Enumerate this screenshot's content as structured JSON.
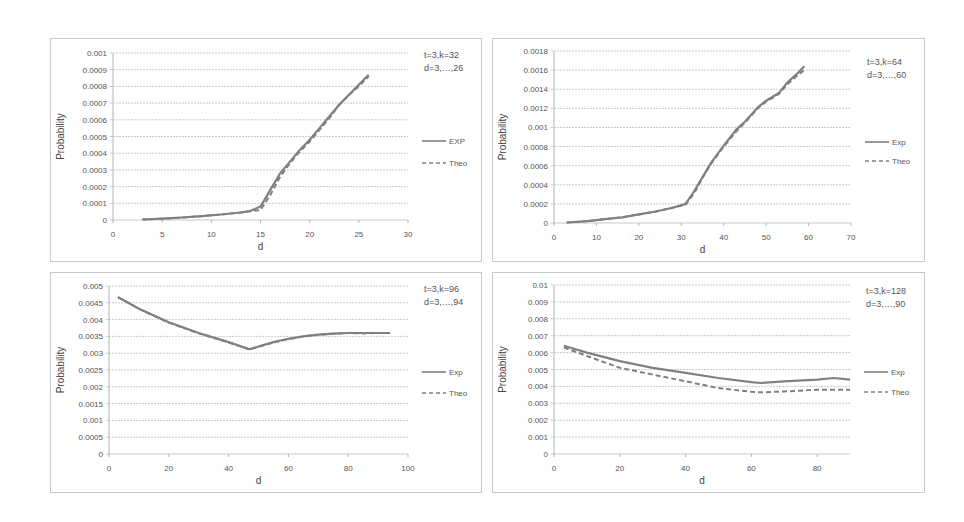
{
  "chart_data": [
    {
      "type": "line",
      "title": "",
      "annotation": [
        "t=3,k=32",
        "d=3,…,26"
      ],
      "xlabel": "d",
      "ylabel": "Probability",
      "xlim": [
        0,
        30
      ],
      "ylim": [
        0,
        0.001
      ],
      "xticks": [
        0,
        5,
        10,
        15,
        20,
        25,
        30
      ],
      "xtick_labels": [
        "0",
        "5",
        "10",
        "15",
        "20",
        "25",
        "30"
      ],
      "yticks": [
        0,
        0.0001,
        0.0002,
        0.0003,
        0.0004,
        0.0005,
        0.0006,
        0.0007,
        0.0008,
        0.0009,
        0.001
      ],
      "ytick_labels": [
        "0",
        "0.0001",
        "0.0002",
        "0.0003",
        "0.0004",
        "0.0005",
        "0.0006",
        "0.0007",
        "0.0008",
        "0.0009",
        "0.001"
      ],
      "grid": true,
      "legend_position": "right",
      "series": [
        {
          "name": "EXP",
          "style": "solid",
          "x": [
            3,
            5,
            7,
            9,
            11,
            13,
            14,
            15,
            16,
            17,
            18,
            19,
            20,
            21,
            22,
            23,
            24,
            25,
            26
          ],
          "y": [
            3e-06,
            8e-06,
            1.5e-05,
            2.3e-05,
            3.3e-05,
            4.5e-05,
            5.5e-05,
            8e-05,
            0.00018,
            0.00028,
            0.00035,
            0.00042,
            0.00048,
            0.00055,
            0.00062,
            0.00069,
            0.00075,
            0.00081,
            0.00087
          ]
        },
        {
          "name": "Theo",
          "style": "dashed",
          "x": [
            3,
            5,
            7,
            9,
            11,
            13,
            14,
            15,
            16,
            17,
            18,
            19,
            20,
            21,
            22,
            23,
            24,
            25,
            26
          ],
          "y": [
            3e-06,
            8e-06,
            1.5e-05,
            2.3e-05,
            3.3e-05,
            4.5e-05,
            5.2e-05,
            6e-05,
            0.00015,
            0.00026,
            0.00034,
            0.00041,
            0.00047,
            0.00054,
            0.00061,
            0.00069,
            0.00075,
            0.0008,
            0.00086
          ]
        }
      ]
    },
    {
      "type": "line",
      "title": "",
      "annotation": [
        "t=3,k=64",
        "d=3,…,60"
      ],
      "xlabel": "d",
      "ylabel": "Probability",
      "xlim": [
        0,
        70
      ],
      "ylim": [
        0,
        0.0018
      ],
      "xticks": [
        0,
        10,
        20,
        30,
        40,
        50,
        60,
        70
      ],
      "xtick_labels": [
        "0",
        "10",
        "20",
        "30",
        "40",
        "50",
        "60",
        "70"
      ],
      "yticks": [
        0,
        0.0002,
        0.0004,
        0.0006,
        0.0008,
        0.001,
        0.0012,
        0.0014,
        0.0016,
        0.0018
      ],
      "ytick_labels": [
        "0",
        "0.0002",
        "0.0004",
        "0.0006",
        "0.0008",
        "0.001",
        "0.0012",
        "0.0014",
        "0.0016",
        "0.0018"
      ],
      "grid": true,
      "legend_position": "right",
      "series": [
        {
          "name": "Exp",
          "style": "solid",
          "x": [
            3,
            8,
            12,
            16,
            20,
            24,
            28,
            31,
            33,
            35,
            37,
            40,
            43,
            45,
            48,
            50,
            53,
            55,
            57,
            59
          ],
          "y": [
            5e-06,
            2e-05,
            4e-05,
            6e-05,
            9e-05,
            0.00012,
            0.00016,
            0.0002,
            0.00033,
            0.00048,
            0.00063,
            0.00081,
            0.00098,
            0.00106,
            0.00121,
            0.00128,
            0.00136,
            0.00147,
            0.00155,
            0.00164
          ]
        },
        {
          "name": "Theo",
          "style": "dashed",
          "x": [
            3,
            8,
            12,
            16,
            20,
            24,
            28,
            31,
            33,
            35,
            37,
            40,
            43,
            45,
            48,
            50,
            53,
            55,
            57,
            59
          ],
          "y": [
            5e-06,
            2e-05,
            4e-05,
            6e-05,
            9e-05,
            0.00012,
            0.00016,
            0.00019,
            0.00031,
            0.00047,
            0.00062,
            0.0008,
            0.00096,
            0.00105,
            0.0012,
            0.00127,
            0.00135,
            0.00145,
            0.00153,
            0.0016
          ]
        }
      ]
    },
    {
      "type": "line",
      "title": "",
      "annotation": [
        "t=3,k=96",
        "d=3,…,94"
      ],
      "xlabel": "d",
      "ylabel": "Probability",
      "xlim": [
        0,
        100
      ],
      "ylim": [
        0,
        0.005
      ],
      "xticks": [
        0,
        20,
        40,
        60,
        80,
        100
      ],
      "xtick_labels": [
        "0",
        "20",
        "40",
        "60",
        "80",
        "100"
      ],
      "yticks": [
        0,
        0.0005,
        0.001,
        0.0015,
        0.002,
        0.0025,
        0.003,
        0.0035,
        0.004,
        0.0045,
        0.005
      ],
      "ytick_labels": [
        "0",
        "0.0005",
        "0.001",
        "0.0015",
        "0.002",
        "0.0025",
        "0.003",
        "0.0035",
        "0.004",
        "0.0045",
        "0.005"
      ],
      "grid": true,
      "legend_position": "right",
      "series": [
        {
          "name": "Exp",
          "style": "solid",
          "x": [
            3,
            10,
            20,
            30,
            40,
            47,
            50,
            55,
            60,
            65,
            70,
            75,
            80,
            85,
            90,
            94
          ],
          "y": [
            0.00467,
            0.00432,
            0.00392,
            0.0036,
            0.00333,
            0.00312,
            0.0032,
            0.00333,
            0.00343,
            0.0035,
            0.00355,
            0.00358,
            0.0036,
            0.0036,
            0.0036,
            0.0036
          ]
        },
        {
          "name": "Theo",
          "style": "dashed",
          "x": [
            3,
            10,
            20,
            30,
            40,
            47,
            50,
            55,
            60,
            65,
            70,
            75,
            80,
            85,
            90,
            94
          ],
          "y": [
            0.00467,
            0.00432,
            0.00391,
            0.00359,
            0.00332,
            0.00311,
            0.00319,
            0.00332,
            0.00342,
            0.0035,
            0.00355,
            0.00358,
            0.0036,
            0.00359,
            0.0036,
            0.0036
          ]
        }
      ]
    },
    {
      "type": "line",
      "title": "",
      "annotation": [
        "t=3,k=128",
        "d=3,…,90"
      ],
      "xlabel": "d",
      "ylabel": "Probability",
      "xlim": [
        0,
        90
      ],
      "ylim": [
        0,
        0.01
      ],
      "xticks": [
        0,
        20,
        40,
        60,
        80
      ],
      "xtick_labels": [
        "0",
        "20",
        "40",
        "60",
        "80"
      ],
      "yticks": [
        0,
        0.001,
        0.002,
        0.003,
        0.004,
        0.005,
        0.006,
        0.007,
        0.008,
        0.009,
        0.01
      ],
      "ytick_labels": [
        "0",
        "0.001",
        "0.002",
        "0.003",
        "0.004",
        "0.005",
        "0.006",
        "0.007",
        "0.008",
        "0.009",
        "0.01"
      ],
      "grid": true,
      "legend_position": "right",
      "series": [
        {
          "name": "Exp",
          "style": "solid",
          "x": [
            3,
            10,
            20,
            30,
            40,
            50,
            60,
            63,
            70,
            80,
            85,
            90
          ],
          "y": [
            0.0064,
            0.006,
            0.0055,
            0.0051,
            0.0048,
            0.0045,
            0.00425,
            0.0042,
            0.0043,
            0.0044,
            0.0045,
            0.0044
          ]
        },
        {
          "name": "Theo",
          "style": "dashed",
          "x": [
            3,
            10,
            20,
            30,
            40,
            50,
            60,
            63,
            70,
            80,
            90
          ],
          "y": [
            0.0063,
            0.0058,
            0.0051,
            0.0047,
            0.0043,
            0.0039,
            0.00368,
            0.00365,
            0.0037,
            0.0038,
            0.0038
          ]
        }
      ]
    }
  ],
  "layout": [
    {
      "box": [
        50,
        38,
        432,
        224
      ],
      "plot": [
        112,
        52,
        407,
        219
      ],
      "legend_y": [
        140,
        162
      ],
      "annot_xy": [
        423,
        48
      ]
    },
    {
      "box": [
        492,
        38,
        433,
        224
      ],
      "plot": [
        553,
        50,
        850,
        222
      ],
      "legend_y": [
        141,
        160
      ],
      "annot_xy": [
        866,
        55
      ]
    },
    {
      "box": [
        50,
        272,
        432,
        221
      ],
      "plot": [
        108,
        285,
        407,
        453
      ],
      "legend_y": [
        371,
        392
      ],
      "annot_xy": [
        423,
        282
      ]
    },
    {
      "box": [
        492,
        272,
        433,
        221
      ],
      "plot": [
        553,
        284,
        849,
        453
      ],
      "legend_y": [
        371,
        391
      ],
      "annot_xy": [
        865,
        284
      ]
    }
  ],
  "style": {
    "line_color": "#808080",
    "grid_color": "#bdbdbd",
    "axis_color": "#a0a0a0"
  }
}
